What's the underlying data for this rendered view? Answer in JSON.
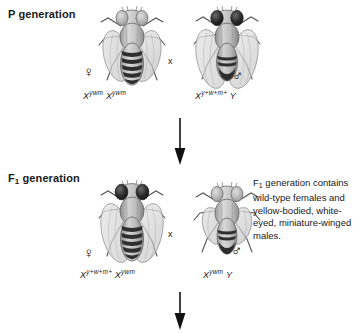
{
  "figure": {
    "type": "genetics-cross-diagram",
    "organism": "Drosophila melanogaster",
    "background_color": "#ffffff",
    "ink_color": "#1a1a1a"
  },
  "rows": {
    "p_generation": {
      "label_prefix": "P",
      "label_text": " generation",
      "female": {
        "sex_symbol": "♀",
        "sex_name": "female",
        "genotype_base": "X",
        "genotype_allele_1": "ywm",
        "genotype_base_2": "X",
        "genotype_allele_2": "ywm",
        "genotype_plain": "Xʸʷᵐ Xʸʷᵐ",
        "phenotype": "yellow-bodied, white-eyed, miniature-winged"
      },
      "cross_symbol": "x",
      "male": {
        "sex_symbol": "♂",
        "sex_name": "male",
        "genotype_base": "X",
        "genotype_allele_1": "y+w+m+",
        "genotype_second": "Y",
        "genotype_plain": "Xʸ⁺ʷ⁺ᵐ⁺ Y",
        "phenotype": "wild-type"
      }
    },
    "f1_generation": {
      "label_prefix": "F",
      "label_sub": "1",
      "label_text": " generation",
      "female": {
        "sex_symbol": "♀",
        "sex_name": "female",
        "genotype_base": "X",
        "genotype_allele_1": "y+w+m+",
        "genotype_base_2": "X",
        "genotype_allele_2": "ywm",
        "genotype_plain": "Xʸ⁺ʷ⁺ᵐ⁺ Xʸʷᵐ",
        "phenotype": "wild-type"
      },
      "cross_symbol": "x",
      "male": {
        "sex_symbol": "♂",
        "sex_name": "male",
        "genotype_base": "X",
        "genotype_allele_1": "ywm",
        "genotype_second": "Y",
        "genotype_plain": "Xʸʷᵐ Y",
        "phenotype": "yellow-bodied, white-eyed, miniature-winged"
      }
    }
  },
  "captions": {
    "f1_note_prefix": "F",
    "f1_note_sub": "1",
    "f1_note_body": " generation contains wild-type females and yellow-bodied, white-eyed, miniature-winged males."
  },
  "arrows": {
    "p_to_f1": "down-arrow",
    "f1_to_f2": "down-arrow"
  }
}
